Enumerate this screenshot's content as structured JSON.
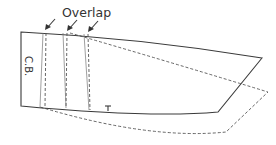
{
  "diagram": {
    "title_label": "Overlap",
    "center_back_label": "C.B.",
    "mark_label": "T",
    "colors": {
      "stroke": "#3a3a3a",
      "dashed": "#555555",
      "background": "#ffffff"
    },
    "arrows": [
      {
        "name": "overlap-arrow-1",
        "target": "first overlap line"
      },
      {
        "name": "overlap-arrow-2",
        "target": "second overlap line"
      },
      {
        "name": "overlap-arrow-3",
        "target": "third overlap line"
      }
    ]
  }
}
